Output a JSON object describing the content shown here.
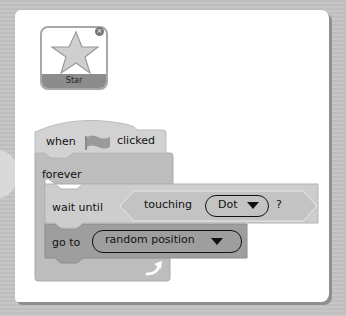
{
  "sprite": {
    "name": "Star",
    "icon": "star-icon",
    "close_icon": "close-icon",
    "close_glyph": "×"
  },
  "script": {
    "hat": {
      "prefix": "when",
      "icon": "green-flag-icon",
      "suffix": "clicked"
    },
    "forever": {
      "label": "forever",
      "loop_icon": "loop-arrow-icon"
    },
    "wait_until": {
      "label": "wait until",
      "condition": {
        "label": "touching",
        "dropdown_value": "Dot",
        "suffix": "?"
      }
    },
    "go_to": {
      "label": "go to",
      "dropdown_value": "random position"
    }
  },
  "colors": {
    "page_bg": "#c4c4c4",
    "panel_bg": "#ffffff",
    "hat_block": "#d2d2d2",
    "control_block": "#bdbdbd",
    "sensing_block": "#c8c8c8",
    "motion_block": "#9e9e9e",
    "sprite_label_bg": "#8c8c8c"
  }
}
